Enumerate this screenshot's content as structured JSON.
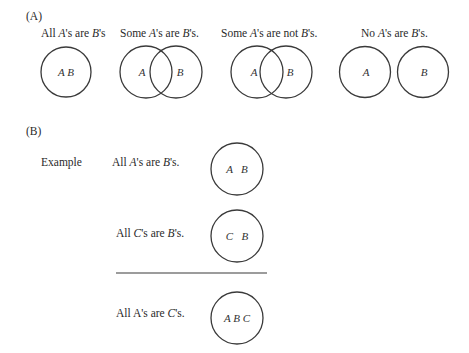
{
  "section_a": {
    "label": "(A)",
    "diagrams": [
      {
        "caption_parts": [
          "All ",
          "A",
          "'s are ",
          "B",
          "'s"
        ],
        "circle_letters": [
          "A B"
        ]
      },
      {
        "caption_parts": [
          "Some ",
          "A",
          "'s are ",
          "B",
          "'s."
        ],
        "circle_letters": [
          "A",
          "B"
        ]
      },
      {
        "caption_parts": [
          "Some ",
          "A",
          "'s are not ",
          "B",
          "'s."
        ],
        "circle_letters": [
          "A",
          "B"
        ]
      },
      {
        "caption_parts": [
          "No ",
          "A",
          "'s are ",
          "B",
          "'s."
        ],
        "circle_letters": [
          "A",
          "B"
        ]
      }
    ]
  },
  "section_b": {
    "label": "(B)",
    "example_label": "Example",
    "premises": [
      {
        "statement_parts": [
          "All ",
          "A",
          "'s are ",
          "B",
          "'s."
        ],
        "circle_text": "A   B"
      },
      {
        "statement_parts": [
          "All ",
          "C",
          "'s are ",
          "B",
          "'s."
        ],
        "circle_text": "C   B"
      }
    ],
    "conclusion": {
      "statement_parts": [
        "All A's are ",
        "C",
        "'s."
      ],
      "circle_text": "A B C"
    }
  },
  "colors": {
    "stroke": "#3a3a3a",
    "text": "#2a2a2a",
    "background": "#ffffff"
  }
}
